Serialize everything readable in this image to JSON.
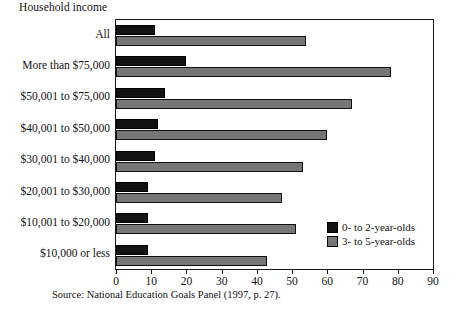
{
  "chart_data": {
    "type": "bar",
    "orientation": "horizontal",
    "title": "Household income",
    "xlabel": "",
    "ylabel": "Household income",
    "xlim": [
      0,
      90
    ],
    "xticks": [
      0,
      10,
      20,
      30,
      40,
      50,
      60,
      70,
      80,
      90
    ],
    "grid": false,
    "legend_position": "inside-bottom-right",
    "categories": [
      "All",
      "More than $75,000",
      "$50,001 to $75,000",
      "$40,001 to $50,000",
      "$30,001 to $40,000",
      "$20,001 to $30,000",
      "$10,001 to $20,000",
      "$10,000 or less"
    ],
    "series": [
      {
        "name": "0- to 2-year-olds",
        "color": "#121212",
        "values": [
          11,
          20,
          14,
          12,
          11,
          9,
          9,
          9
        ]
      },
      {
        "name": "3- to 5-year-olds",
        "color": "#767676",
        "values": [
          54,
          78,
          67,
          60,
          53,
          47,
          51,
          43
        ]
      }
    ],
    "source": "Source: National Education Goals Panel (1997, p. 27)."
  }
}
